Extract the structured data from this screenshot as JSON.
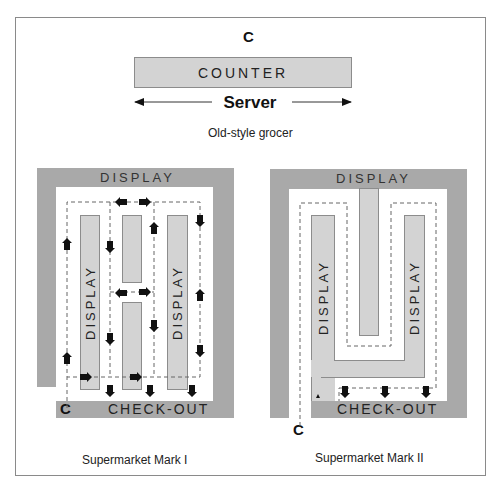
{
  "old_style": {
    "customer_label": "C",
    "counter_label": "COUNTER",
    "server_label": "Server",
    "caption": "Old-style grocer"
  },
  "mark1": {
    "top_display_label": "DISPLAY",
    "aisle_display_left": "DISPLAY",
    "aisle_display_right": "DISPLAY",
    "checkout_label": "CHECK-OUT",
    "customer_label": "C",
    "caption": "Supermarket Mark I"
  },
  "mark2": {
    "top_display_label": "DISPLAY",
    "aisle_display_left": "DISPLAY",
    "aisle_display_right": "DISPLAY",
    "checkout_label": "CHECK-OUT",
    "customer_label": "C",
    "caption": "Supermarket Mark II"
  },
  "colors": {
    "wall": "#a9a9a9",
    "display": "#d3d3d3",
    "path": "#555555",
    "arrow": "#111111"
  }
}
